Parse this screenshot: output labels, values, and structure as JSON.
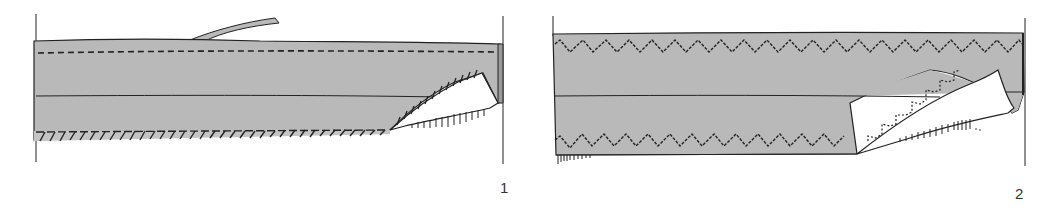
{
  "diagram": {
    "type": "sewing-technique-illustration",
    "colors": {
      "fabric": "#b9b9b9",
      "fabric_underside": "#ffffff",
      "line": "#222222",
      "label": "#333333"
    },
    "figures": [
      {
        "label": "1",
        "description": "Hem with slanted overcast stitching; right corner folded back showing underside",
        "stitch": "slanted-overcast"
      },
      {
        "label": "2",
        "description": "Hem with zigzag stitching; right corner folded back showing zigzag on underside",
        "stitch": "zigzag"
      }
    ]
  }
}
